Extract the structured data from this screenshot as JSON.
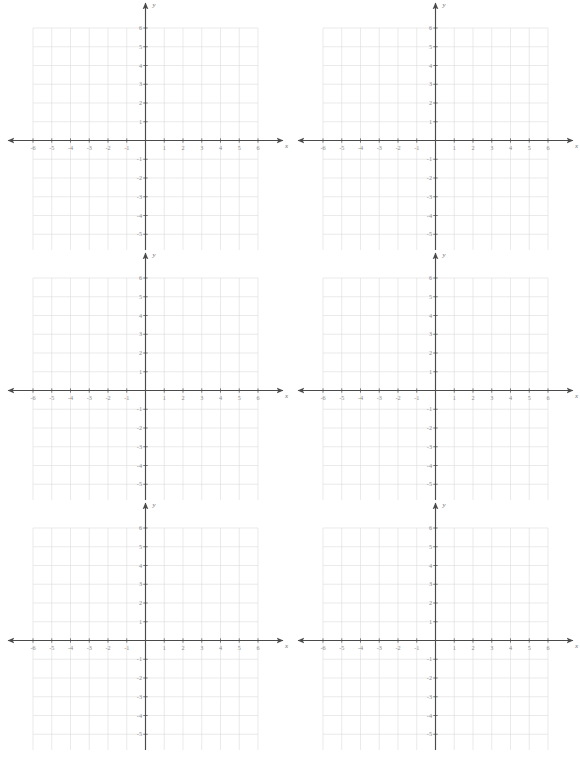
{
  "page": {
    "corner_mark": "",
    "background_color": "#ffffff"
  },
  "graph_style": {
    "grid_line_color": "#dcdcdc",
    "axis_color": "#4a4a4a",
    "tick_label_color": "#8a8a8a",
    "axis_label_color": "#6f6f6f"
  },
  "chart_data": {
    "type": "scatter",
    "title": "",
    "xlabel": "x",
    "ylabel": "y",
    "xlim": [
      -6,
      6
    ],
    "ylim": [
      -6,
      6
    ],
    "grid": true,
    "legend": null,
    "series": [],
    "x_tick_labels": [
      "-6",
      "-5",
      "-4",
      "-3",
      "-2",
      "-1",
      "1",
      "2",
      "3",
      "4",
      "5",
      "6"
    ],
    "y_tick_labels": [
      "6",
      "5",
      "4",
      "3",
      "2",
      "1",
      "-1",
      "-2",
      "-3",
      "-4",
      "-5",
      "-6"
    ],
    "x_tick_values": [
      -6,
      -5,
      -4,
      -3,
      -2,
      -1,
      1,
      2,
      3,
      4,
      5,
      6
    ],
    "y_tick_values": [
      6,
      5,
      4,
      3,
      2,
      1,
      -1,
      -2,
      -3,
      -4,
      -5,
      -6
    ]
  },
  "grids": [
    {
      "id": "graph-1",
      "row": 1,
      "column": 1,
      "x_axis_label": "x",
      "y_axis_label": "y"
    },
    {
      "id": "graph-2",
      "row": 1,
      "column": 2,
      "x_axis_label": "x",
      "y_axis_label": "y"
    },
    {
      "id": "graph-3",
      "row": 2,
      "column": 1,
      "x_axis_label": "x",
      "y_axis_label": "y"
    },
    {
      "id": "graph-4",
      "row": 2,
      "column": 2,
      "x_axis_label": "x",
      "y_axis_label": "y"
    },
    {
      "id": "graph-5",
      "row": 3,
      "column": 1,
      "x_axis_label": "x",
      "y_axis_label": "y"
    },
    {
      "id": "graph-6",
      "row": 3,
      "column": 2,
      "x_axis_label": "x",
      "y_axis_label": "y"
    }
  ]
}
